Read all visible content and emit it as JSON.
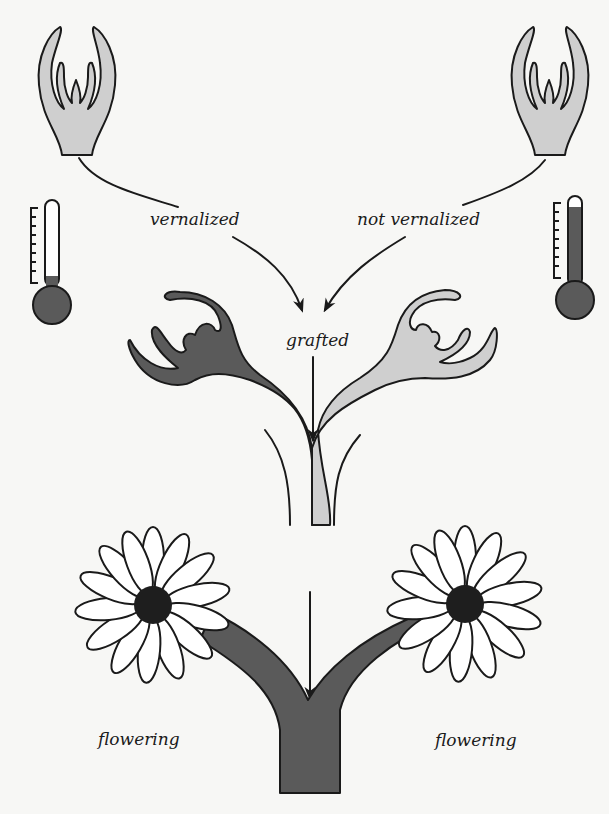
{
  "diagram": {
    "colors": {
      "background": "#f7f7f5",
      "ink": "#1a1a1a",
      "vernalized_tissue": "#5a5a5a",
      "non_vernalized_tissue": "#cfcfcf",
      "petal": "#ffffff",
      "flower_center": "#1e1e1e"
    },
    "nodes": [
      {
        "id": "shoot-left",
        "description": "Shoot apex (light, before treatment)",
        "icon": "shoot-apex-icon"
      },
      {
        "id": "shoot-right",
        "description": "Shoot apex (light, before treatment)",
        "icon": "shoot-apex-icon"
      },
      {
        "id": "thermometer-left",
        "description": "Cold temperature (low mercury level)",
        "icon": "thermometer-cold-icon"
      },
      {
        "id": "thermometer-right",
        "description": "Warm temperature (high mercury level)",
        "icon": "thermometer-warm-icon"
      },
      {
        "id": "grafted-plant",
        "description": "Grafted Y-shaped plant: left branch dark (vernalized), right branch light (not vernalized)"
      },
      {
        "id": "flowering-plant",
        "description": "Y-shaped plant, both branches dark, each bearing a daisy-like flower"
      }
    ],
    "labels": {
      "left_treatment": "vernalized",
      "right_treatment": "not vernalized",
      "combined": "grafted",
      "left_result": "flowering",
      "right_result": "flowering"
    },
    "edges": [
      {
        "from": "shoot-left",
        "to": "vernalized"
      },
      {
        "from": "shoot-right",
        "to": "not vernalized"
      },
      {
        "from": "vernalized",
        "to": "grafted",
        "arrow": true
      },
      {
        "from": "not vernalized",
        "to": "grafted",
        "arrow": true
      },
      {
        "from": "grafted",
        "to": "flowering-plant",
        "arrow": true
      }
    ]
  }
}
